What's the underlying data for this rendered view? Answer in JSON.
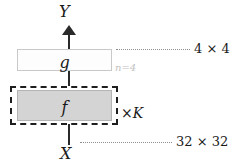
{
  "diagram": {
    "axis": {
      "output_label": "Y",
      "input_label": "X",
      "arrow_direction": "up"
    },
    "blocks": [
      {
        "id": "g",
        "label": "g",
        "fill": "#fdfdfd",
        "border": "#c9c9c9",
        "annotation": "n=4"
      },
      {
        "id": "f",
        "label": "f",
        "fill": "#d4d4d4",
        "border": "#b4b4b4",
        "repeat_label_times": "×",
        "repeat_label_var": "K"
      }
    ],
    "annotations": {
      "top_size": "4 × 4",
      "bottom_size": "32 × 32",
      "n_value": "n=4",
      "n_color": "#c2c2c2"
    },
    "colors": {
      "background": "#ffffff",
      "ink": "#1a1a1a",
      "leader": "#8e8e8e",
      "dashed": "#1e1e1e"
    }
  }
}
